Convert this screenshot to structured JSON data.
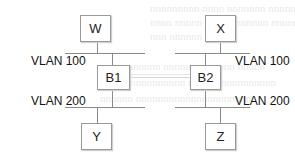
{
  "diagram": {
    "type": "network-topology",
    "nodes": {
      "w": {
        "label": "W"
      },
      "x": {
        "label": "X"
      },
      "b1": {
        "label": "B1"
      },
      "b2": {
        "label": "B2"
      },
      "y": {
        "label": "Y"
      },
      "z": {
        "label": "Z"
      }
    },
    "segments": {
      "left_top": {
        "label": "VLAN 100"
      },
      "right_top": {
        "label": "VLAN 100"
      },
      "left_bottom": {
        "label": "VLAN 200"
      },
      "right_bottom": {
        "label": "VLAN 200"
      }
    },
    "edges": [
      {
        "from": "W",
        "to": "VLAN 100 (left)"
      },
      {
        "from": "B1",
        "to": "VLAN 100 (left)"
      },
      {
        "from": "B1",
        "to": "VLAN 200 (left)"
      },
      {
        "from": "Y",
        "to": "VLAN 200 (left)"
      },
      {
        "from": "X",
        "to": "VLAN 100 (right)"
      },
      {
        "from": "B2",
        "to": "VLAN 100 (right)"
      },
      {
        "from": "B2",
        "to": "VLAN 200 (right)"
      },
      {
        "from": "Z",
        "to": "VLAN 200 (right)"
      },
      {
        "from": "B1",
        "to": "B2"
      }
    ],
    "colors": {
      "line": "#8a8a8a",
      "box_border": "#9a9a9a",
      "text": "#222222"
    }
  }
}
